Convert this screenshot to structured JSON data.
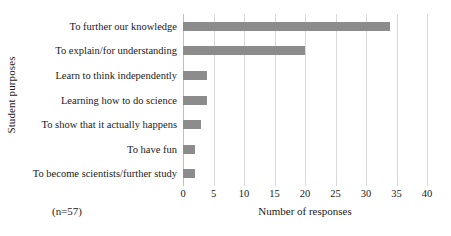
{
  "chart_data": {
    "type": "bar",
    "orientation": "horizontal",
    "title": "",
    "xlabel": "Number of responses",
    "ylabel": "Student purposes",
    "categories": [
      "To further our knowledge",
      "To explain/for understanding",
      "Learn to think independently",
      "Learning how to do science",
      "To show that it actually happens",
      "To have fun",
      "To become scientists/further study"
    ],
    "values": [
      34,
      20,
      4,
      4,
      3,
      2,
      2
    ],
    "xlim": [
      0,
      40
    ],
    "xticks": [
      0,
      5,
      10,
      15,
      20,
      25,
      30,
      35,
      40
    ],
    "xtick_labels": [
      "0",
      "5",
      "10",
      "15",
      "20",
      "25",
      "30",
      "35",
      "40"
    ],
    "grid": "vertical",
    "legend": "none",
    "annotation": "(n=57)",
    "bar_color": "#8c8c8c",
    "gridline_color": "#d9d9d9",
    "background_color": "#ffffff",
    "text_color": "#1a1a1a"
  }
}
